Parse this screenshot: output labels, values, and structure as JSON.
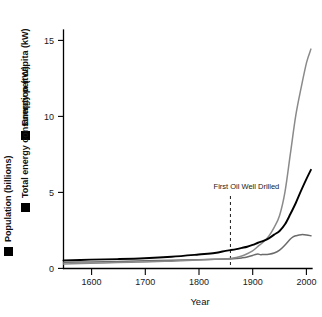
{
  "chart_data": {
    "type": "line",
    "title": "",
    "xlabel": "Year",
    "ylabel": "",
    "xlim": [
      1550,
      2010
    ],
    "ylim": [
      0,
      16.2
    ],
    "grid": false,
    "legend_position": "left-outside-vertical",
    "x_ticks": [
      1600,
      1700,
      1800,
      1900,
      2000
    ],
    "x_tick_labels": [
      "1600",
      "1700",
      "1800",
      "1900",
      "2000"
    ],
    "y_ticks": [
      0,
      5,
      10,
      15
    ],
    "y_tick_labels": [
      "0",
      "5",
      "10",
      "15"
    ],
    "annotations": [
      {
        "label": "First Oil Well Drilled",
        "x": 1859,
        "type": "vertical-dashed-line"
      }
    ],
    "series": [
      {
        "name": "Energy per capita (kW)",
        "color": "#6b6b6b",
        "unit": "kW",
        "x": [
          1550,
          1600,
          1650,
          1700,
          1750,
          1800,
          1830,
          1850,
          1859,
          1870,
          1880,
          1890,
          1900,
          1905,
          1910,
          1915,
          1920,
          1930,
          1940,
          1950,
          1960,
          1970,
          1975,
          1980,
          1990,
          2000,
          2008
        ],
        "values": [
          0.42,
          0.45,
          0.48,
          0.52,
          0.56,
          0.6,
          0.62,
          0.64,
          0.65,
          0.68,
          0.72,
          0.78,
          0.88,
          0.95,
          0.98,
          0.94,
          0.95,
          0.97,
          1.05,
          1.25,
          1.6,
          2.0,
          2.15,
          2.22,
          2.3,
          2.28,
          2.22
        ]
      },
      {
        "name": "Total energy consumption (tW)",
        "color": "#8a8a8a",
        "unit": "tW",
        "x": [
          1550,
          1600,
          1650,
          1700,
          1750,
          1800,
          1830,
          1850,
          1859,
          1870,
          1880,
          1890,
          1900,
          1910,
          1920,
          1930,
          1940,
          1950,
          1960,
          1970,
          1980,
          1990,
          2000,
          2008
        ],
        "values": [
          0.3,
          0.35,
          0.4,
          0.45,
          0.5,
          0.58,
          0.62,
          0.66,
          0.68,
          0.75,
          0.85,
          1.0,
          1.2,
          1.5,
          1.8,
          2.2,
          2.8,
          3.6,
          5.2,
          7.8,
          10.4,
          12.3,
          14.0,
          14.9
        ]
      },
      {
        "name": "Population (billions)",
        "color": "#000000",
        "unit": "billions",
        "x": [
          1550,
          1600,
          1650,
          1700,
          1750,
          1800,
          1830,
          1850,
          1859,
          1870,
          1880,
          1890,
          1900,
          1910,
          1920,
          1930,
          1940,
          1950,
          1960,
          1970,
          1980,
          1990,
          2000,
          2008
        ],
        "values": [
          0.55,
          0.6,
          0.64,
          0.7,
          0.8,
          0.95,
          1.05,
          1.2,
          1.25,
          1.32,
          1.4,
          1.48,
          1.6,
          1.75,
          1.88,
          2.05,
          2.3,
          2.55,
          3.0,
          3.7,
          4.45,
          5.3,
          6.1,
          6.7
        ]
      }
    ]
  },
  "legend": {
    "items": [
      {
        "label": "Energy per capita (kW)",
        "swatch_color": "#6b6b6b"
      },
      {
        "label": "Total energy consumption (tW)",
        "swatch_color": "#8a8a8a"
      },
      {
        "label": "Population (billions)",
        "swatch_color": "#111111"
      }
    ]
  },
  "axes": {
    "x_title": "Year",
    "x_tick_labels": [
      "1600",
      "1700",
      "1800",
      "1900",
      "2000"
    ],
    "y_tick_labels": [
      "0",
      "5",
      "10",
      "15"
    ]
  },
  "annotation": {
    "text": "First Oil Well Drilled"
  }
}
